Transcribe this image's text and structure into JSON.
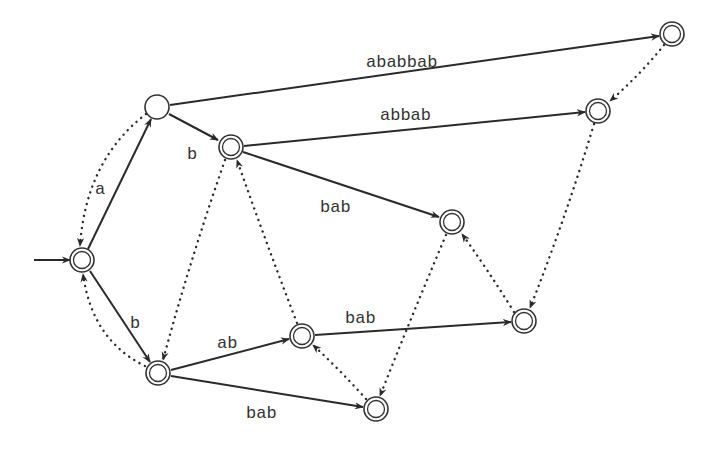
{
  "diagram": {
    "type": "automaton",
    "nodes": [
      {
        "id": "q0",
        "x": 82,
        "y": 260,
        "accepting": true,
        "start": true
      },
      {
        "id": "qa",
        "x": 157,
        "y": 107,
        "accepting": false
      },
      {
        "id": "qb",
        "x": 231,
        "y": 147,
        "accepting": true
      },
      {
        "id": "qB",
        "x": 158,
        "y": 373,
        "accepting": true
      },
      {
        "id": "qab",
        "x": 302,
        "y": 336,
        "accepting": true
      },
      {
        "id": "qbab1",
        "x": 452,
        "y": 222,
        "accepting": true
      },
      {
        "id": "qbab2",
        "x": 524,
        "y": 321,
        "accepting": true
      },
      {
        "id": "qbab3",
        "x": 376,
        "y": 409,
        "accepting": true
      },
      {
        "id": "qabbab",
        "x": 598,
        "y": 111,
        "accepting": true
      },
      {
        "id": "qababbab",
        "x": 672,
        "y": 34,
        "accepting": true
      }
    ],
    "edges": [
      {
        "from": "q0",
        "to": "qa",
        "label": "a",
        "lx": 95,
        "ly": 189
      },
      {
        "from": "q0",
        "to": "qB",
        "label": "b",
        "lx": 130,
        "ly": 323
      },
      {
        "from": "qa",
        "to": "qb",
        "label": "b",
        "lx": 189,
        "ly": 154
      },
      {
        "from": "qa",
        "to": "qababbab",
        "label": "ababbab",
        "lx": 366,
        "ly": 68
      },
      {
        "from": "qb",
        "to": "qabbab",
        "label": "abbab",
        "lx": 380,
        "ly": 116
      },
      {
        "from": "qb",
        "to": "qbab1",
        "label": "bab",
        "lx": 322,
        "ly": 208
      },
      {
        "from": "qB",
        "to": "qab",
        "label": "ab",
        "lx": 216,
        "ly": 345
      },
      {
        "from": "qB",
        "to": "qbab3",
        "label": "bab",
        "lx": 246,
        "ly": 417
      },
      {
        "from": "qab",
        "to": "qbab2",
        "label": "bab",
        "lx": 345,
        "ly": 321
      }
    ],
    "failure_links": [
      {
        "from": "qa",
        "to": "q0"
      },
      {
        "from": "qB",
        "to": "q0"
      },
      {
        "from": "qb",
        "to": "qB"
      },
      {
        "from": "qab",
        "to": "qb"
      },
      {
        "from": "qbab1",
        "to": "qbab3"
      },
      {
        "from": "qbab2",
        "to": "qbab1"
      },
      {
        "from": "qbab3",
        "to": "qab"
      },
      {
        "from": "qabbab",
        "to": "qbab2"
      },
      {
        "from": "qababbab",
        "to": "qabbab"
      }
    ],
    "labels": {
      "a": "a",
      "b1": "b",
      "b2": "b",
      "ababbab": "ababbab",
      "abbab": "abbab",
      "bab1": "bab",
      "ab": "ab",
      "bab2": "bab",
      "bab3": "bab"
    }
  }
}
